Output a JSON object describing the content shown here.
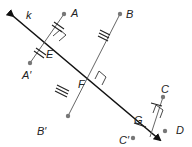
{
  "diagram": {
    "line_label": "k",
    "points": {
      "A": "A",
      "A_prime": "A′",
      "B": "B",
      "B_prime": "B′",
      "C": "C",
      "C_prime": "C′",
      "D": "D",
      "E": "E",
      "F": "F",
      "G": "G"
    },
    "colors": {
      "line": "#111111",
      "segment": "#555555",
      "point": "#777777"
    }
  }
}
